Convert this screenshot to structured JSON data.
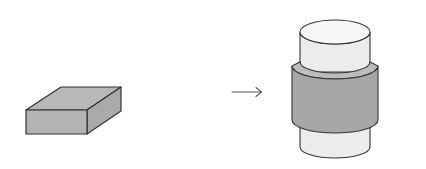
{
  "diagram": {
    "colors": {
      "background": "#ffffff",
      "stroke": "#333333",
      "block_fill": "#b3b3b3",
      "band_fill": "#a6a6a6",
      "band_top_fill": "#bdbdbd",
      "cylinder_fill": "#ececec",
      "cylinder_top_fill": "#f7f7f7",
      "arrow": "#555555"
    },
    "elements": [
      {
        "id": "block",
        "label": "rectangular block",
        "shape": "box"
      },
      {
        "id": "arrow",
        "label": "transformation arrow",
        "shape": "arrow-right"
      },
      {
        "id": "cylinder",
        "label": "cylinder with band",
        "shape": "cylinder"
      }
    ]
  }
}
